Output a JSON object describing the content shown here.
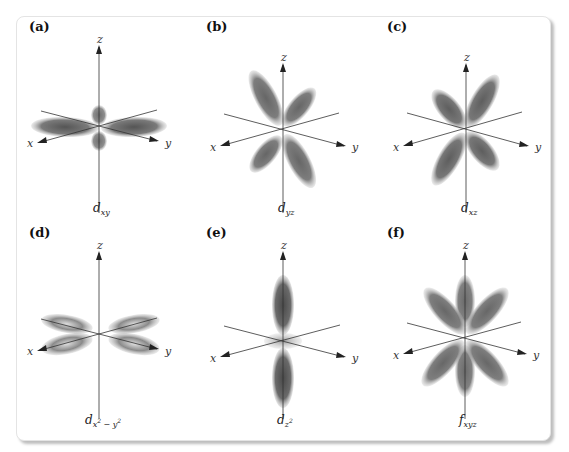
{
  "figure": {
    "panels": [
      {
        "id": "a",
        "label": "(a)",
        "orbital": "d",
        "subscript": "xy",
        "caption_text": "d_xy",
        "axes": {
          "x": "x",
          "y": "y",
          "z": "z"
        }
      },
      {
        "id": "b",
        "label": "(b)",
        "orbital": "d",
        "subscript": "yz",
        "caption_text": "d_yz",
        "axes": {
          "x": "x",
          "y": "y",
          "z": "z"
        }
      },
      {
        "id": "c",
        "label": "(c)",
        "orbital": "d",
        "subscript": "xz",
        "caption_text": "d_xz",
        "axes": {
          "x": "x",
          "y": "y",
          "z": "z"
        }
      },
      {
        "id": "d",
        "label": "(d)",
        "orbital": "d",
        "subscript": "x",
        "subscript_sup1": "2",
        "subscript_mid": " − y",
        "subscript_sup2": "2",
        "caption_text": "d_x²−y²",
        "axes": {
          "x": "x",
          "y": "y",
          "z": "z"
        }
      },
      {
        "id": "e",
        "label": "(e)",
        "orbital": "d",
        "subscript": "z",
        "subscript_sup1": "2",
        "caption_text": "d_z²",
        "axes": {
          "x": "x",
          "y": "y",
          "z": "z"
        }
      },
      {
        "id": "f",
        "label": "(f)",
        "orbital": "f",
        "subscript": "xyz",
        "caption_text": "f_xyz",
        "axes": {
          "x": "x",
          "y": "y",
          "z": "z"
        }
      }
    ],
    "colors": {
      "lobe": "#6e6e6e",
      "axis": "#333333",
      "card_border": "#e4e4e4",
      "shadow": "#bdbdbd"
    }
  }
}
